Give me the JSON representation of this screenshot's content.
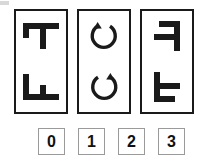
{
  "puzzle": {
    "type": "visual-analogy-matrix",
    "stroke_color": "#1a1a1a",
    "panel_border_color": "#1a1a1a",
    "option_border_color": "#9a9a9a",
    "background_color": "#ffffff",
    "panels": [
      {
        "name": "panel-1",
        "cells": [
          {
            "position": "top",
            "icon": "f-letter-rotated-90-cw",
            "description": "Letter F rotated 90 degrees clockwise"
          },
          {
            "position": "bottom",
            "icon": "f-letter-rotated-90-ccw",
            "description": "Letter F rotated 90 degrees counter-clockwise"
          }
        ]
      },
      {
        "name": "panel-2",
        "cells": [
          {
            "position": "top",
            "icon": "circular-arrow-counterclockwise",
            "description": "Circular arrow with arrowhead at top pointing counter-clockwise"
          },
          {
            "position": "bottom",
            "icon": "circular-arrow-clockwise",
            "description": "Circular arrow with arrowhead at top pointing clockwise"
          }
        ]
      },
      {
        "name": "panel-3",
        "cells": [
          {
            "position": "top",
            "icon": "f-letter-mirrored-rotated-180",
            "description": "Letter F rotated 180 degrees, stem on right with arms to the left"
          },
          {
            "position": "bottom",
            "icon": "f-letter-mirrored",
            "description": "Letter F mirrored, stem on left with arms to the right"
          }
        ]
      }
    ],
    "options": [
      {
        "label": "0",
        "value": 0
      },
      {
        "label": "1",
        "value": 1
      },
      {
        "label": "2",
        "value": 2
      },
      {
        "label": "3",
        "value": 3
      }
    ]
  }
}
